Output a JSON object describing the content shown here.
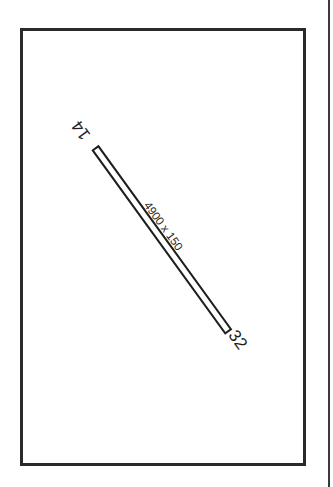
{
  "diagram": {
    "type": "airport-runway-diagram",
    "runway": {
      "end_a": "14",
      "end_b": "32",
      "dimensions": "4900 x 150",
      "length_ft": 4900,
      "width_ft": 150,
      "orientation_deg": 140
    },
    "colors": {
      "line": "#1e1e1e",
      "background": "#ffffff"
    }
  }
}
